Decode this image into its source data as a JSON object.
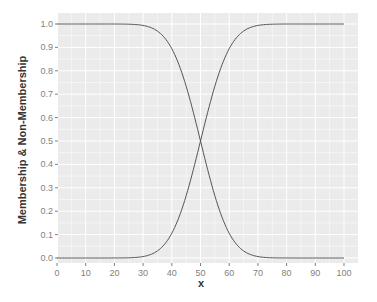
{
  "chart_data": {
    "type": "line",
    "title": "",
    "xlabel": "x",
    "ylabel": "Membership & Non-Membership",
    "xlim": [
      0,
      100
    ],
    "ylim": [
      0,
      1
    ],
    "x_ticks": [
      "0",
      "10",
      "20",
      "30",
      "40",
      "50",
      "60",
      "70",
      "80",
      "90",
      "100"
    ],
    "y_ticks": [
      "0.0",
      "0.1",
      "0.2",
      "0.3",
      "0.4",
      "0.5",
      "0.6",
      "0.7",
      "0.8",
      "0.9",
      "1.0"
    ],
    "grid": true,
    "legend": "none",
    "x": [
      0,
      10,
      20,
      25,
      30,
      35,
      40,
      45,
      50,
      55,
      60,
      65,
      70,
      75,
      80,
      90,
      100
    ],
    "series": [
      {
        "name": "non-membership (decreasing)",
        "values": [
          1.0,
          1.0,
          1.0,
          0.999,
          0.994,
          0.97,
          0.89,
          0.73,
          0.5,
          0.27,
          0.11,
          0.03,
          0.006,
          0.001,
          0.0,
          0.0,
          0.0
        ]
      },
      {
        "name": "membership (increasing)",
        "values": [
          0.0,
          0.0,
          0.0,
          0.001,
          0.006,
          0.03,
          0.11,
          0.27,
          0.5,
          0.73,
          0.89,
          0.97,
          0.994,
          0.999,
          1.0,
          1.0,
          1.0
        ]
      }
    ],
    "colors": {
      "panel": "#ebebeb",
      "grid": "#ffffff",
      "line": "#555555"
    }
  }
}
